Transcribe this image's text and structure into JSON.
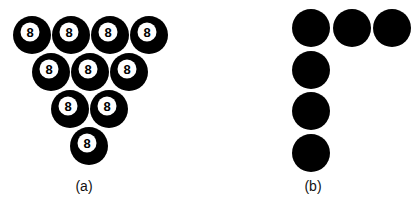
{
  "panels": {
    "a": {
      "label": "(a)",
      "ball_number": "8",
      "description": "Triangle of ten 8-balls arranged in rows of 4, 3, 2, 1",
      "rows": [
        4,
        3,
        2,
        1
      ],
      "balls": [
        {
          "cx": 32,
          "cy": 35,
          "number": "8"
        },
        {
          "cx": 71,
          "cy": 35,
          "number": "8"
        },
        {
          "cx": 110,
          "cy": 35,
          "number": "8"
        },
        {
          "cx": 149,
          "cy": 35,
          "number": "8"
        },
        {
          "cx": 51,
          "cy": 72,
          "number": "8"
        },
        {
          "cx": 90,
          "cy": 72,
          "number": "8"
        },
        {
          "cx": 129,
          "cy": 72,
          "number": "8"
        },
        {
          "cx": 70,
          "cy": 109,
          "number": "8"
        },
        {
          "cx": 109,
          "cy": 109,
          "number": "8"
        },
        {
          "cx": 89,
          "cy": 146,
          "number": "8"
        }
      ]
    },
    "b": {
      "label": "(b)",
      "description": "Seven plain black circles forming a Γ (gamma / upside-down L) shape",
      "balls": [
        {
          "cx": 311,
          "cy": 28
        },
        {
          "cx": 352,
          "cy": 28
        },
        {
          "cx": 392,
          "cy": 28
        },
        {
          "cx": 311,
          "cy": 70
        },
        {
          "cx": 311,
          "cy": 111
        },
        {
          "cx": 311,
          "cy": 153
        }
      ]
    }
  },
  "colors": {
    "ball": "#000000",
    "ball_face": "#ffffff",
    "number": "#000000",
    "background": "#ffffff"
  },
  "sizes": {
    "ball_radius": 19,
    "face_radius": 9.5
  }
}
